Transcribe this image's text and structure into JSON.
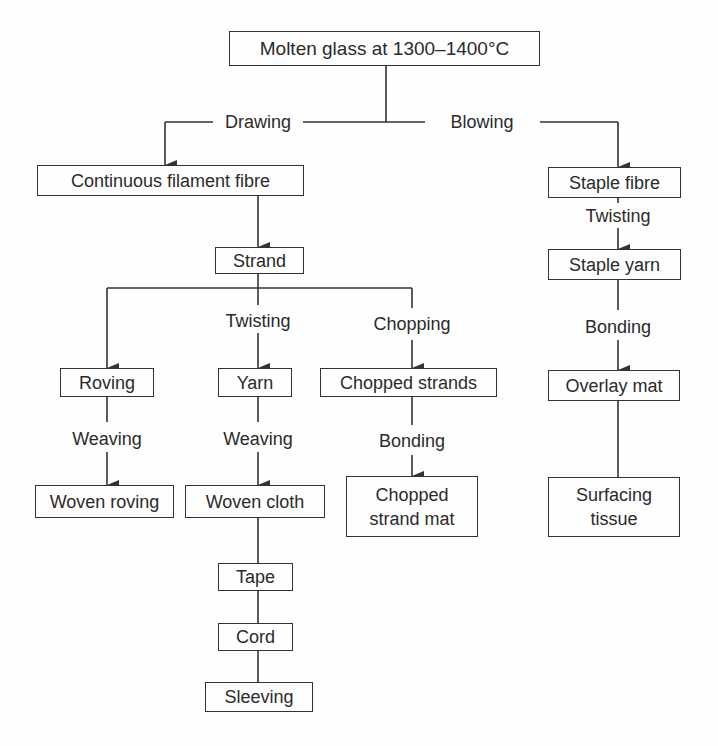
{
  "diagram": {
    "type": "flowchart",
    "nodes": {
      "molten": "Molten glass at 1300–1400°C",
      "continuous": "Continuous filament fibre",
      "strand": "Strand",
      "roving": "Roving",
      "yarn": "Yarn",
      "chopped_strands": "Chopped strands",
      "woven_roving": "Woven roving",
      "woven_cloth": "Woven cloth",
      "chopped_strand_mat_1": "Chopped",
      "chopped_strand_mat_2": "strand mat",
      "tape": "Tape",
      "cord": "Cord",
      "sleeving": "Sleeving",
      "staple_fibre": "Staple fibre",
      "staple_yarn": "Staple yarn",
      "overlay_mat": "Overlay mat",
      "surfacing_tissue_1": "Surfacing",
      "surfacing_tissue_2": "tissue"
    },
    "processes": {
      "drawing": "Drawing",
      "blowing": "Blowing",
      "twisting_strand": "Twisting",
      "chopping": "Chopping",
      "weaving_roving": "Weaving",
      "weaving_yarn": "Weaving",
      "bonding_chopped": "Bonding",
      "twisting_staple": "Twisting",
      "bonding_staple": "Bonding"
    },
    "edges": [
      {
        "from": "Molten glass at 1300–1400°C",
        "to": "Continuous filament fibre",
        "process": "Drawing"
      },
      {
        "from": "Molten glass at 1300–1400°C",
        "to": "Staple fibre",
        "process": "Blowing"
      },
      {
        "from": "Continuous filament fibre",
        "to": "Strand",
        "process": ""
      },
      {
        "from": "Strand",
        "to": "Roving",
        "process": ""
      },
      {
        "from": "Strand",
        "to": "Yarn",
        "process": "Twisting"
      },
      {
        "from": "Strand",
        "to": "Chopped strands",
        "process": "Chopping"
      },
      {
        "from": "Roving",
        "to": "Woven roving",
        "process": "Weaving"
      },
      {
        "from": "Yarn",
        "to": "Woven cloth",
        "process": "Weaving"
      },
      {
        "from": "Chopped strands",
        "to": "Chopped strand mat",
        "process": "Bonding"
      },
      {
        "from": "Woven cloth",
        "to": "Tape",
        "process": ""
      },
      {
        "from": "Tape",
        "to": "Cord",
        "process": ""
      },
      {
        "from": "Cord",
        "to": "Sleeving",
        "process": ""
      },
      {
        "from": "Staple fibre",
        "to": "Staple yarn",
        "process": "Twisting"
      },
      {
        "from": "Staple yarn",
        "to": "Overlay mat",
        "process": "Bonding"
      },
      {
        "from": "Overlay mat",
        "to": "Surfacing tissue",
        "process": ""
      }
    ],
    "colors": {
      "line": "#333333",
      "text": "#2b2b2b",
      "background": "#fefefe"
    }
  }
}
